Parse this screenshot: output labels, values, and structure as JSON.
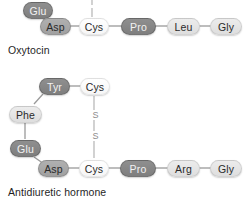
{
  "figure": {
    "background_color": "#ffffff",
    "bond_color": "#9a9a9a",
    "shades": {
      "dark": "#868686",
      "medium": "#a8a8a8",
      "light": "#e5e5e5",
      "white": "#ffffff"
    }
  },
  "oxytocin": {
    "caption": "Oxytocin",
    "residues": [
      {
        "label": "Glu",
        "shade": "dark"
      },
      {
        "label": "Asp",
        "shade": "medium"
      },
      {
        "label": "Cys",
        "shade": "white"
      },
      {
        "label": "Pro",
        "shade": "dark"
      },
      {
        "label": "Leu",
        "shade": "light"
      },
      {
        "label": "Gly",
        "shade": "light"
      }
    ],
    "disulfide_stub": "|"
  },
  "antidiuretic_hormone": {
    "caption": "Antidiuretic hormone",
    "residues": [
      {
        "label": "Tyr",
        "shade": "dark"
      },
      {
        "label": "Cys",
        "shade": "white"
      },
      {
        "label": "Phe",
        "shade": "light"
      },
      {
        "label": "Glu",
        "shade": "dark"
      },
      {
        "label": "Asp",
        "shade": "medium"
      },
      {
        "label": "Cys",
        "shade": "white"
      },
      {
        "label": "Pro",
        "shade": "dark"
      },
      {
        "label": "Arg",
        "shade": "light"
      },
      {
        "label": "Gly",
        "shade": "light"
      }
    ],
    "disulfide_bridge": {
      "sulfur_upper": "S",
      "sulfur_lower": "S"
    }
  }
}
